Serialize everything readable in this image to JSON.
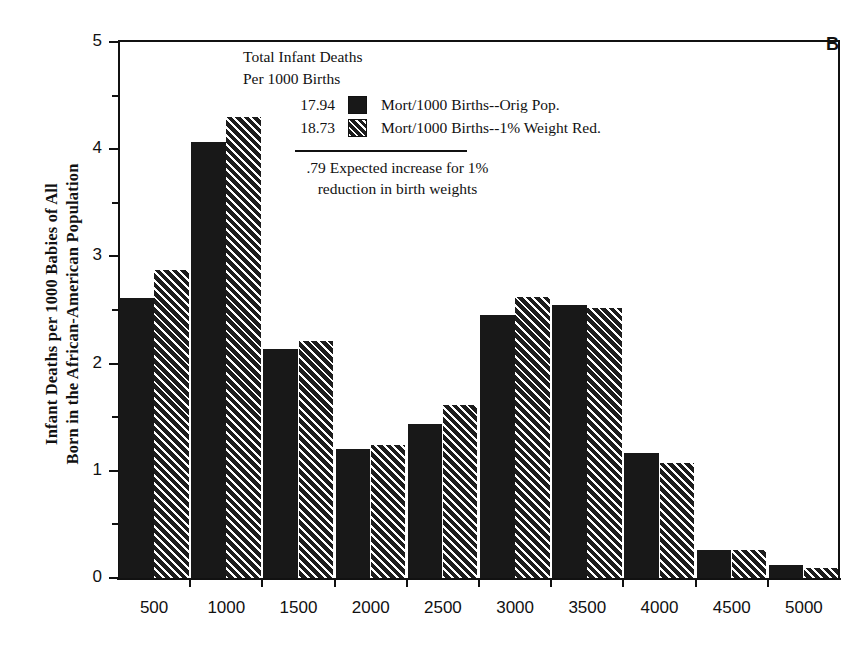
{
  "panel_letter": "B",
  "axis": {
    "y_title_line1": "Infant Deaths per 1000 Babies of All",
    "y_title_line2": "Born in the African-American Population",
    "y_ticks": [
      "0",
      "1",
      "2",
      "3",
      "4",
      "5"
    ],
    "x_ticks": [
      "500",
      "1000",
      "1500",
      "2000",
      "2500",
      "3000",
      "3500",
      "4000",
      "4500",
      "5000"
    ]
  },
  "legend": {
    "head_line1": "Total Infant Deaths",
    "head_line2": "Per 1000 Births",
    "rows": [
      {
        "value": "17.94",
        "swatch": "solid",
        "label": "Mort/1000 Births--Orig Pop."
      },
      {
        "value": "18.73",
        "swatch": "hatch",
        "label": "Mort/1000 Births--1% Weight Red."
      }
    ],
    "note_line1": ".79 Expected increase for 1%",
    "note_line2": "reduction in birth weights"
  },
  "colors": {
    "series1": "#181818",
    "series2": "#1d1d1d",
    "axis": "#111111",
    "background": "#ffffff"
  },
  "chart_data": {
    "type": "bar",
    "title": "",
    "xlabel": "",
    "ylabel": "Infant Deaths per 1000 Babies of All Born in the African-American Population",
    "ylim": [
      0,
      5
    ],
    "grid": false,
    "legend_position": "top-center",
    "categories": [
      "500",
      "1000",
      "1500",
      "2000",
      "2500",
      "3000",
      "3500",
      "4000",
      "4500",
      "5000"
    ],
    "series": [
      {
        "name": "Mort/1000 Births--Orig Pop.",
        "total": 17.94,
        "values": [
          2.61,
          4.07,
          2.14,
          1.2,
          1.44,
          2.45,
          2.55,
          1.17,
          0.26,
          0.12
        ]
      },
      {
        "name": "Mort/1000 Births--1% Weight Red.",
        "total": 18.73,
        "values": [
          2.87,
          4.3,
          2.21,
          1.24,
          1.61,
          2.62,
          2.52,
          1.07,
          0.26,
          0.09
        ]
      }
    ],
    "annotations": [
      {
        "text": ".79 Expected increase for 1% reduction in birth weights",
        "value": 0.79
      }
    ]
  }
}
